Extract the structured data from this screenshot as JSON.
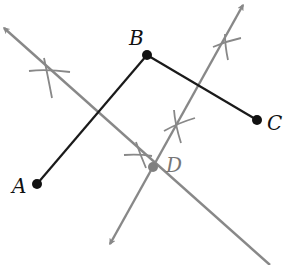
{
  "diagram": {
    "colors": {
      "segment": "#1a1a1a",
      "construction": "#888888",
      "background": "#ffffff",
      "point": "#111111",
      "point_d": "#808080"
    },
    "points": {
      "A": {
        "label": "A",
        "x": 37,
        "y": 184
      },
      "B": {
        "label": "B",
        "x": 147,
        "y": 55
      },
      "C": {
        "label": "C",
        "x": 257,
        "y": 120
      },
      "D": {
        "label": "D",
        "x": 153,
        "y": 167
      }
    },
    "segments": [
      {
        "from": "A",
        "to": "B"
      },
      {
        "from": "B",
        "to": "C"
      }
    ],
    "construction_lines": [
      {
        "name": "perpendicular-bisector-AB",
        "x1": 4,
        "y1": 28,
        "x2": 270,
        "y2": 265,
        "arrow_start": true,
        "arrow_end": false
      },
      {
        "name": "perpendicular-bisector-BC",
        "x1": 243,
        "y1": 5,
        "x2": 110,
        "y2": 244,
        "arrow_start": true,
        "arrow_end": true
      }
    ],
    "arc_marks": [
      {
        "cx": 46,
        "cy": 69
      },
      {
        "cx": 139,
        "cy": 154
      },
      {
        "cx": 226,
        "cy": 44
      },
      {
        "cx": 176,
        "cy": 127
      }
    ]
  }
}
